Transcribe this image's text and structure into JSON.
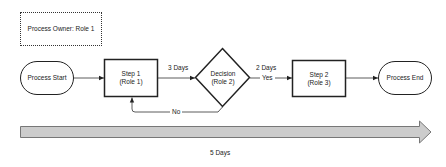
{
  "owner": {
    "label": "Process Owner: Role 1"
  },
  "nodes": {
    "start": {
      "label": "Process Start",
      "shape": "terminator"
    },
    "step1": {
      "line1": "Step 1",
      "line2": "(Role 1)",
      "shape": "process"
    },
    "decision": {
      "line1": "Decision",
      "line2": "(Role 2)",
      "shape": "decision"
    },
    "step2": {
      "line1": "Step 2",
      "line2": "(Role 3)",
      "shape": "process"
    },
    "end": {
      "label": "Process End",
      "shape": "terminator"
    }
  },
  "edges": {
    "step1_to_decision": {
      "label": "3 Days"
    },
    "decision_to_step2": {
      "label": "2 Days",
      "branch": "Yes"
    },
    "decision_to_step1": {
      "branch": "No"
    }
  },
  "timeline": {
    "label": "5 Days",
    "fill_color": "#cccccc",
    "stroke_color": "#777777"
  },
  "colors": {
    "stroke": "#222222",
    "background": "#ffffff"
  }
}
